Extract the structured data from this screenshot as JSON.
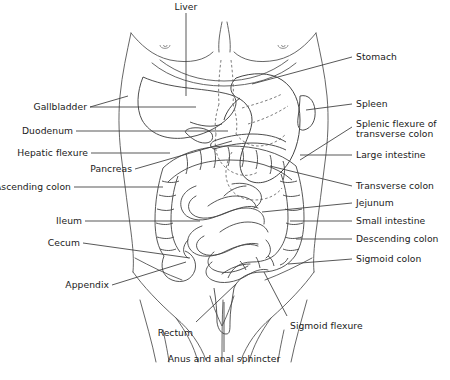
{
  "figure": {
    "colors": {
      "background": "#ffffff",
      "text": "#1a1a1a",
      "leader_line": "#3a3a3a",
      "body_outline": "#555555",
      "organ_outline": "#444444",
      "hidden_outline": "#666666"
    },
    "labels": {
      "liver": "Liver",
      "gallbladder": "Gallbladder",
      "duodenum": "Duodenum",
      "hepatic_flexure": "Hepatic flexure",
      "pancreas": "Pancreas",
      "ascending_colon": "Ascending colon",
      "ileum": "Ileum",
      "cecum": "Cecum",
      "appendix": "Appendix",
      "stomach": "Stomach",
      "spleen": "Spleen",
      "splenic_flexure_line1": "Splenic flexure of",
      "splenic_flexure_line2": "transverse colon",
      "large_intestine": "Large intestine",
      "transverse_colon": "Transverse colon",
      "jejunum": "Jejunum",
      "small_intestine": "Small intestine",
      "descending_colon": "Descending colon",
      "sigmoid_colon": "Sigmoid colon",
      "sigmoid_flexure": "Sigmoid flexure",
      "rectum": "Rectum",
      "anus": "Anus and anal sphincter"
    }
  }
}
